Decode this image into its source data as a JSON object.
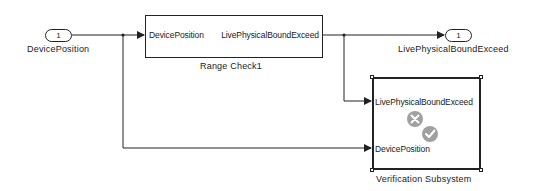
{
  "diagram": {
    "inport": {
      "number": "1",
      "label": "DevicePosition"
    },
    "outport": {
      "number": "1",
      "label": "LivePhysicalBoundExceed"
    },
    "range_check": {
      "name": "Range Check1",
      "input_port": "DevicePosition",
      "output_port": "LivePhysicalBoundExceed"
    },
    "verification_subsystem": {
      "name": "Verification Subsystem",
      "input_ports": [
        "LivePhysicalBoundExceed",
        "DevicePosition"
      ],
      "icons": [
        "x-circle-icon",
        "check-circle-icon"
      ],
      "icon_color": "#a0a0a0"
    },
    "line_color": "#222222"
  }
}
